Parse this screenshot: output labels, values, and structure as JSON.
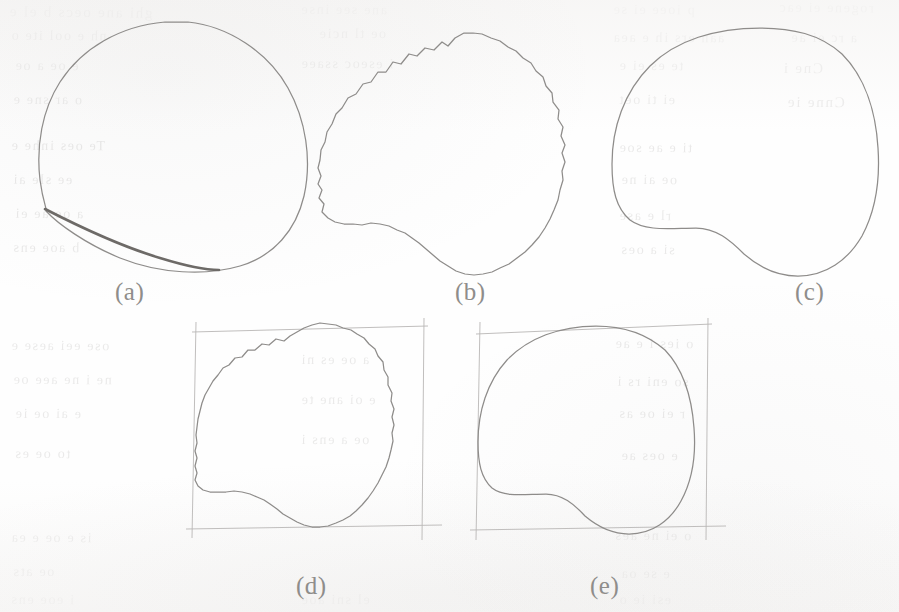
{
  "document": {
    "type": "scanned-paper-figure",
    "page_background": "#fefefe",
    "ink_color": "#8e8c8a",
    "dark_ink_color": "#6d6a67",
    "bbox_color": "#b9b7b5",
    "caption_color": "#8f8d8b"
  },
  "figure": {
    "panel_count": 5,
    "panels": [
      {
        "id": "a",
        "label": "(a)",
        "description": "smooth closed convex outline with a darker thick chord along the lower-left",
        "has_bounding_box": false,
        "label_x": 115,
        "label_y": 278,
        "outline": "M 165 22 C 120 26, 82 48, 60 82 C 42 110, 36 146, 40 180 C 43 203, 48 212, 46 211 C 58 224, 86 244, 120 258 C 160 274, 206 276, 240 266 C 274 256, 296 230, 304 196 C 312 160, 306 120, 288 88 C 268 52, 228 26, 188 22 Z",
        "dark_chord": "M 45 209 C 78 226, 120 246, 160 258 C 186 266, 206 270, 219 270"
      },
      {
        "id": "b",
        "label": "(b)",
        "description": "jagged noisy contour with concave lower-left notch",
        "has_bounding_box": false,
        "label_x": 455,
        "label_y": 278,
        "outline": "M 455 38 L 448 46 L 442 42 L 434 50 L 425 48 L 417 56 L 409 54 L 401 64 L 393 62 L 386 72 L 378 72 L 371 82 L 363 84 L 356 94 L 348 98 L 342 108 L 336 114 L 332 124 L 327 132 L 325 142 L 321 150 L 320 160 L 318 168 L 321 176 L 318 184 L 322 190 L 319 198 L 324 204 L 322 212 L 328 218 L 335 222 L 344 224 L 353 224 L 362 225 L 371 223 L 380 224 L 389 226 L 397 230 L 405 233 L 412 238 L 419 243 L 426 249 L 433 255 L 440 261 L 448 266 L 456 271 L 465 274 L 474 275 L 483 274 L 492 272 L 500 268 L 509 264 L 517 258 L 525 252 L 532 245 L 539 237 L 545 228 L 550 219 L 554 210 L 558 200 L 560 190 L 563 180 L 562 171 L 565 162 L 562 153 L 565 145 L 561 136 L 563 127 L 558 119 L 559 110 L 553 102 L 552 93 L 546 86 L 543 77 L 536 71 L 531 63 L 523 58 L 516 51 L 508 47 L 500 41 L 491 38 L 482 34 L 473 33 L 464 33 Z"
      },
      {
        "id": "c",
        "label": "(c)",
        "description": "smoothed version of panel b, same silhouette without jagged noise",
        "has_bounding_box": false,
        "label_x": 795,
        "label_y": 278,
        "outline": "M 760 28 C 716 28, 676 40, 650 66 C 624 92, 612 128, 612 164 C 612 190, 616 208, 630 220 C 646 232, 672 228, 696 228 C 716 228, 730 240, 744 254 C 760 268, 778 276, 798 276 C 826 276, 848 260, 862 236 C 876 210, 880 178, 878 148 C 876 114, 866 78, 842 54 C 820 34, 792 28, 760 28 Z"
      },
      {
        "id": "d",
        "label": "(d)",
        "description": "jagged contour of panel b enclosed in a faint hand-drawn bounding box",
        "has_bounding_box": true,
        "label_x": 296,
        "label_y": 572,
        "bbox_lines": [
          {
            "x1": 192,
            "y1": 332,
            "x2": 428,
            "y2": 326
          },
          {
            "x1": 186,
            "y1": 529,
            "x2": 442,
            "y2": 525
          },
          {
            "x1": 196,
            "y1": 322,
            "x2": 192,
            "y2": 538
          },
          {
            "x1": 424,
            "y1": 318,
            "x2": 422,
            "y2": 540
          }
        ],
        "outline": "M 290 336 L 284 341 L 276 339 L 269 345 L 262 344 L 255 350 L 248 350 L 242 357 L 235 358 L 229 365 L 223 368 L 218 375 L 213 381 L 209 388 L 205 395 L 202 403 L 200 411 L 198 419 L 197 427 L 196 435 L 197 443 L 195 451 L 197 458 L 195 466 L 197 473 L 195 480 L 198 486 L 203 490 L 210 492 L 218 492 L 226 492 L 234 491 L 242 492 L 250 494 L 257 497 L 264 500 L 270 504 L 277 509 L 283 514 L 290 518 L 297 522 L 304 525 L 312 527 L 320 527 L 328 526 L 336 523 L 343 520 L 350 516 L 356 511 L 362 505 L 368 498 L 373 491 L 378 483 L 382 475 L 386 467 L 389 458 L 391 450 L 393 441 L 392 433 L 394 425 L 392 417 L 394 409 L 391 401 L 392 393 L 388 385 L 388 377 L 384 370 L 383 362 L 378 356 L 375 349 L 369 344 L 364 338 L 357 334 L 351 330 L 343 328 L 336 325 L 328 324 L 320 323 L 312 325 L 304 328 L 297 332 Z"
      },
      {
        "id": "e",
        "label": "(e)",
        "description": "smoothed contour of panel c enclosed in a faint hand-drawn bounding box",
        "has_bounding_box": true,
        "label_x": 590,
        "label_y": 572,
        "bbox_lines": [
          {
            "x1": 476,
            "y1": 334,
            "x2": 712,
            "y2": 324
          },
          {
            "x1": 470,
            "y1": 530,
            "x2": 726,
            "y2": 526
          },
          {
            "x1": 480,
            "y1": 322,
            "x2": 476,
            "y2": 540
          },
          {
            "x1": 708,
            "y1": 318,
            "x2": 706,
            "y2": 540
          }
        ],
        "outline": "M 596 326 C 560 326, 528 338, 507 360 C 487 382, 478 412, 478 442 C 478 463, 481 478, 492 488 C 505 498, 526 494, 546 494 C 562 494, 574 504, 585 516 C 598 527, 613 534, 629 534 C 652 534, 670 521, 681 501 C 693 479, 696 453, 694 428 C 692 400, 684 370, 665 350 C 647 334, 623 326, 596 326 Z"
      }
    ]
  },
  "bleed_through_text": {
    "note": "faint mirrored show-through text from the reverse side of the page; individual words are not legible",
    "fragments": [
      {
        "text": "ghi ane oecs b el e",
        "x": 8,
        "y": 4,
        "size": 15,
        "rot": -0.6
      },
      {
        "text": "ane   see   inse",
        "x": 300,
        "y": 2,
        "size": 14,
        "rot": -0.4
      },
      {
        "text": "p  ioee   ei  se",
        "x": 612,
        "y": 2,
        "size": 14,
        "rot": -0.3
      },
      {
        "text": "rogene   ei  eac",
        "x": 778,
        "y": 0,
        "size": 14,
        "rot": -0.5
      },
      {
        "text": "nh e   ool  ite   o",
        "x": 10,
        "y": 28,
        "size": 14,
        "rot": -0.4
      },
      {
        "text": "oe   tl  ncie",
        "x": 318,
        "y": 26,
        "size": 14,
        "rot": -0.2
      },
      {
        "text": "aan  ers  ih  e  aea",
        "x": 612,
        "y": 30,
        "size": 14,
        "rot": -0.3
      },
      {
        "text": "a   rc   ei  ae",
        "x": 790,
        "y": 30,
        "size": 14,
        "rot": -0.4
      },
      {
        "text": "e   oe   a   oe",
        "x": 14,
        "y": 58,
        "size": 14,
        "rot": -0.3
      },
      {
        "text": "i  eseoc   ssaee",
        "x": 300,
        "y": 56,
        "size": 14,
        "rot": -0.2
      },
      {
        "text": "te   es  ei  e",
        "x": 618,
        "y": 58,
        "size": 14,
        "rot": -0.3
      },
      {
        "text": "Cne  i",
        "x": 782,
        "y": 60,
        "size": 15,
        "rot": -0.4
      },
      {
        "text": "o   ar   sne   e",
        "x": 12,
        "y": 92,
        "size": 14,
        "rot": -0.3
      },
      {
        "text": "ei   ti   oet",
        "x": 618,
        "y": 92,
        "size": 14,
        "rot": -0.3
      },
      {
        "text": "Cnne   ie",
        "x": 786,
        "y": 94,
        "size": 15,
        "rot": -0.4
      },
      {
        "text": "Te   oes   inhe   e",
        "x": 10,
        "y": 138,
        "size": 14,
        "rot": -0.3
      },
      {
        "text": "ti  e   ae  soe",
        "x": 618,
        "y": 140,
        "size": 14,
        "rot": -0.3
      },
      {
        "text": "ee   sle   ai",
        "x": 12,
        "y": 172,
        "size": 14,
        "rot": -0.3
      },
      {
        "text": "oe   ai  ne",
        "x": 620,
        "y": 172,
        "size": 14,
        "rot": -0.3
      },
      {
        "text": "a   oe   ae   ei",
        "x": 14,
        "y": 206,
        "size": 14,
        "rot": -0.3
      },
      {
        "text": "rl  e   ase",
        "x": 618,
        "y": 208,
        "size": 14,
        "rot": -0.3
      },
      {
        "text": "b   aoe   ens",
        "x": 12,
        "y": 240,
        "size": 14,
        "rot": -0.3
      },
      {
        "text": "si   a   oes",
        "x": 620,
        "y": 242,
        "size": 14,
        "rot": -0.3
      },
      {
        "text": "ose   eei   aese   e",
        "x": 10,
        "y": 338,
        "size": 14,
        "rot": -0.3
      },
      {
        "text": "o   ies   i   e  ae",
        "x": 614,
        "y": 336,
        "size": 14,
        "rot": -0.3
      },
      {
        "text": "ne  i  ne  aee   oe",
        "x": 12,
        "y": 372,
        "size": 14,
        "rot": -0.3
      },
      {
        "text": "so   eni   rs   i",
        "x": 616,
        "y": 374,
        "size": 14,
        "rot": -0.3
      },
      {
        "text": "e   ai  oe  ie",
        "x": 14,
        "y": 406,
        "size": 14,
        "rot": -0.3
      },
      {
        "text": "r   ei   oe  as",
        "x": 618,
        "y": 406,
        "size": 14,
        "rot": -0.3
      },
      {
        "text": "to  oe  es",
        "x": 14,
        "y": 446,
        "size": 14,
        "rot": -0.3
      },
      {
        "text": "e   oes   ae",
        "x": 620,
        "y": 448,
        "size": 14,
        "rot": -0.3
      },
      {
        "text": "is  e  oe   e  ea",
        "x": 10,
        "y": 530,
        "size": 14,
        "rot": -0.3
      },
      {
        "text": "o   ei   ne   aes",
        "x": 614,
        "y": 528,
        "size": 14,
        "rot": -0.3
      },
      {
        "text": "oe   ats",
        "x": 12,
        "y": 564,
        "size": 14,
        "rot": -0.3
      },
      {
        "text": "e   se   oa",
        "x": 620,
        "y": 566,
        "size": 14,
        "rot": -0.3
      },
      {
        "text": "i   eoe   ens",
        "x": 10,
        "y": 592,
        "size": 14,
        "rot": -0.3
      },
      {
        "text": "esi   ie   o",
        "x": 618,
        "y": 592,
        "size": 14,
        "rot": -0.3
      },
      {
        "text": "el  sni  aoe",
        "x": 300,
        "y": 592,
        "size": 14,
        "rot": -0.2
      },
      {
        "text": "a  oe  es  ni",
        "x": 300,
        "y": 352,
        "size": 14,
        "rot": -0.2
      },
      {
        "text": "e  oi  ane  te",
        "x": 300,
        "y": 392,
        "size": 14,
        "rot": -0.2
      },
      {
        "text": "oe  a  ens  i",
        "x": 300,
        "y": 432,
        "size": 14,
        "rot": -0.2
      }
    ]
  }
}
